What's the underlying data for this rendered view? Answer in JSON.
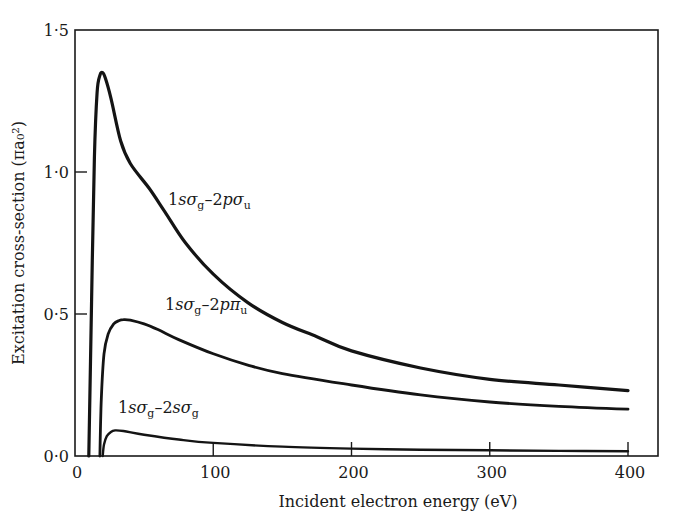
{
  "chart_data": {
    "type": "line",
    "title": "",
    "xlabel": "Incident electron energy (eV)",
    "ylabel": "Excitation cross-section (πa₀²)",
    "xlim": [
      0,
      420
    ],
    "ylim": [
      0,
      1.5
    ],
    "xticks": [
      0,
      100,
      200,
      300,
      400
    ],
    "xtick_labels": [
      "0",
      "100",
      "200",
      "300",
      "400"
    ],
    "yticks": [
      0,
      0.5,
      1.0,
      1.5
    ],
    "ytick_labels": [
      "0·0",
      "0·5",
      "1·0",
      "1·5"
    ],
    "grid": false,
    "legend": "inline labels",
    "series": [
      {
        "name": "1sσg–2pσu",
        "label_parts": [
          "1",
          "sσ",
          "g",
          "–2",
          "pσ",
          "u"
        ],
        "label_pos": [
          168,
          205
        ],
        "stroke_width": 3.2,
        "x": [
          10,
          12,
          14,
          16,
          18,
          20,
          22,
          26,
          33,
          40,
          54,
          65,
          80,
          100,
          125,
          150,
          175,
          200,
          250,
          300,
          350,
          400
        ],
        "y": [
          0.0,
          0.55,
          1.05,
          1.28,
          1.34,
          1.35,
          1.33,
          1.26,
          1.11,
          1.03,
          0.94,
          0.86,
          0.75,
          0.64,
          0.54,
          0.47,
          0.42,
          0.37,
          0.31,
          0.27,
          0.25,
          0.23
        ]
      },
      {
        "name": "1sσg–2pπu",
        "label_parts": [
          "1",
          "sσ",
          "g",
          "–2",
          "pπ",
          "u"
        ],
        "label_pos": [
          165,
          310
        ],
        "stroke_width": 2.8,
        "x": [
          18,
          19,
          21,
          24,
          28,
          32,
          35,
          40,
          50,
          60,
          75,
          100,
          125,
          150,
          200,
          250,
          300,
          350,
          400
        ],
        "y": [
          0.0,
          0.2,
          0.36,
          0.43,
          0.465,
          0.477,
          0.48,
          0.478,
          0.465,
          0.445,
          0.41,
          0.36,
          0.32,
          0.29,
          0.25,
          0.215,
          0.19,
          0.175,
          0.165
        ]
      },
      {
        "name": "1sσg–2sσg",
        "label_parts": [
          "1",
          "sσ",
          "g",
          "–2",
          "sσ",
          "g"
        ],
        "label_pos": [
          118,
          413
        ],
        "stroke_width": 2.4,
        "x": [
          20,
          21,
          23,
          26,
          29,
          35,
          50,
          75,
          100,
          150,
          200,
          250,
          300,
          350,
          400
        ],
        "y": [
          0.0,
          0.04,
          0.07,
          0.085,
          0.09,
          0.088,
          0.075,
          0.058,
          0.046,
          0.033,
          0.026,
          0.022,
          0.02,
          0.018,
          0.017
        ]
      }
    ]
  },
  "layout_px": {
    "plot_left": 75,
    "plot_right": 658,
    "plot_top": 30,
    "plot_bottom": 456,
    "px_per_ev": 1.3825,
    "px_per_unit": 284
  }
}
